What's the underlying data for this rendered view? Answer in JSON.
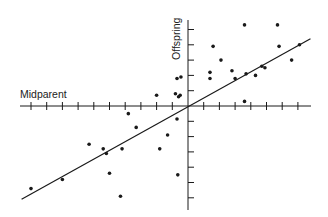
{
  "chart_data": {
    "type": "scatter",
    "title": "",
    "xlabel": "Midparent",
    "ylabel": "Offspring",
    "grid": false,
    "legend": null,
    "xlim": [
      -10.5,
      7.8
    ],
    "ylim": [
      -6.2,
      6.0
    ],
    "x_ticks": [
      -10,
      -9,
      -8,
      -7,
      -6,
      -5,
      -4,
      -3,
      -2,
      -1,
      1,
      2,
      3,
      4,
      5,
      6,
      7
    ],
    "y_ticks": [
      -6,
      -5,
      -4,
      -3,
      -2,
      -1,
      1,
      2,
      3,
      4,
      5
    ],
    "tick_labels_shown": false,
    "points": [
      {
        "x": -10.0,
        "y": -5.4
      },
      {
        "x": -8.0,
        "y": -4.8
      },
      {
        "x": -6.3,
        "y": -2.5
      },
      {
        "x": -5.4,
        "y": -2.8
      },
      {
        "x": -5.2,
        "y": -3.1
      },
      {
        "x": -5.0,
        "y": -4.4
      },
      {
        "x": -4.3,
        "y": -5.9
      },
      {
        "x": -4.2,
        "y": -2.8
      },
      {
        "x": -3.8,
        "y": -0.5
      },
      {
        "x": -3.3,
        "y": -1.4
      },
      {
        "x": -2.0,
        "y": 0.7
      },
      {
        "x": -1.8,
        "y": -2.8
      },
      {
        "x": -1.3,
        "y": -1.9
      },
      {
        "x": -0.7,
        "y": 1.8
      },
      {
        "x": -0.45,
        "y": 1.9
      },
      {
        "x": -0.8,
        "y": 0.8
      },
      {
        "x": -0.6,
        "y": 0.6
      },
      {
        "x": -0.5,
        "y": 0.7
      },
      {
        "x": -0.7,
        "y": -0.85
      },
      {
        "x": -0.65,
        "y": -4.5
      },
      {
        "x": 1.4,
        "y": 2.2
      },
      {
        "x": 1.4,
        "y": 1.8
      },
      {
        "x": 1.6,
        "y": 3.9
      },
      {
        "x": 2.1,
        "y": 3.0
      },
      {
        "x": 2.8,
        "y": 2.3
      },
      {
        "x": 3.0,
        "y": 1.8
      },
      {
        "x": 3.6,
        "y": 5.3
      },
      {
        "x": 3.6,
        "y": 0.3
      },
      {
        "x": 3.7,
        "y": 2.1
      },
      {
        "x": 4.3,
        "y": 2.0
      },
      {
        "x": 4.7,
        "y": 2.6
      },
      {
        "x": 4.9,
        "y": 2.5
      },
      {
        "x": 5.7,
        "y": 5.3
      },
      {
        "x": 5.8,
        "y": 3.9
      },
      {
        "x": 6.6,
        "y": 3.0
      },
      {
        "x": 7.1,
        "y": 4.0
      }
    ],
    "regression_line": {
      "x1": -10.6,
      "y1": -6.1,
      "x2": 7.8,
      "y2": 4.4,
      "slope": 0.57,
      "intercept": 0
    }
  },
  "layout": {
    "origin_px": [
      188,
      106
    ],
    "x_unit_px": 15.7,
    "y_unit_px": 15.3,
    "x_axis_px": [
      20,
      311
    ],
    "y_axis_px": [
      20,
      210
    ],
    "ink": "#1a1a1a"
  },
  "labels": {
    "x": "Midparent",
    "y": "Offspring"
  }
}
